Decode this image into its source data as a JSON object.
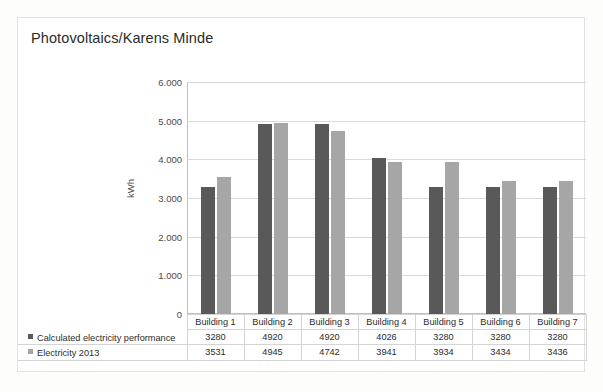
{
  "chart": {
    "title": "Photovoltaics/Karens Minde"
  },
  "chart_data": {
    "type": "bar",
    "title": "Photovoltaics/Karens Minde",
    "xlabel": "",
    "ylabel": "kWh",
    "ylim": [
      0,
      6000
    ],
    "yticks": [
      0,
      1000,
      2000,
      3000,
      4000,
      5000,
      6000
    ],
    "ytick_labels": [
      "0",
      "1.000",
      "2.000",
      "3.000",
      "4.000",
      "5.000",
      "6.000"
    ],
    "grid": true,
    "legend_position": "data-table",
    "categories": [
      "Building 1",
      "Building 2",
      "Building 3",
      "Building 4",
      "Building 5",
      "Building 6",
      "Building 7"
    ],
    "series": [
      {
        "name": "Calculated electricity performance",
        "color": "#595959",
        "values": [
          3280,
          4920,
          4920,
          4026,
          3280,
          3280,
          3280
        ]
      },
      {
        "name": "Electricity 2013",
        "color": "#a6a6a6",
        "values": [
          3531,
          4945,
          4742,
          3941,
          3934,
          3434,
          3436
        ]
      }
    ]
  }
}
